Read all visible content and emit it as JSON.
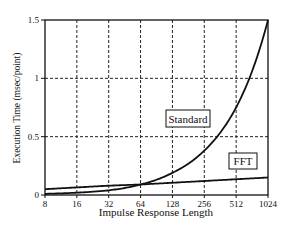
{
  "chart_data": {
    "type": "line",
    "title": "",
    "xlabel": "Impulse Response Length",
    "ylabel": "Execution Time (msec/point)",
    "x_scale": "log2",
    "x": [
      8,
      16,
      32,
      64,
      128,
      256,
      512,
      1024
    ],
    "x_tick_labels": [
      "8",
      "16",
      "32",
      "64",
      "128",
      "256",
      "512",
      "1024"
    ],
    "y_ticks": [
      0,
      0.5,
      1,
      1.5
    ],
    "y_tick_labels": [
      "0",
      "0.5",
      "1",
      "1.5"
    ],
    "ylim": [
      0,
      1.5
    ],
    "grid": true,
    "series": [
      {
        "name": "Standard",
        "values": [
          0.01,
          0.02,
          0.04,
          0.09,
          0.19,
          0.38,
          0.75,
          1.5
        ]
      },
      {
        "name": "FFT",
        "values": [
          0.05,
          0.065,
          0.08,
          0.09,
          0.105,
          0.12,
          0.135,
          0.15
        ]
      }
    ],
    "annotations": [
      "Standard",
      "FFT"
    ]
  }
}
